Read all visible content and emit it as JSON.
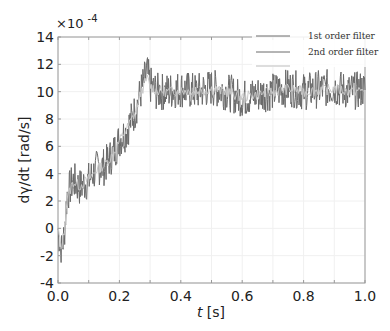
{
  "chart_data": {
    "type": "line",
    "title": "",
    "xlabel": "t [s]",
    "ylabel": "dγ/dt [rad/s]",
    "y_multiplier": "×10^-4",
    "xlim": [
      0.0,
      1.0
    ],
    "ylim": [
      -4,
      14
    ],
    "x_ticks": [
      "0.0",
      "0.2",
      "0.4",
      "0.6",
      "0.8",
      "1.0"
    ],
    "y_ticks": [
      "-4",
      "-2",
      "0",
      "2",
      "4",
      "6",
      "8",
      "10",
      "12",
      "14"
    ],
    "grid": true,
    "legend_position": "upper right",
    "legend": [
      "1st order filter",
      "2nd order filter",
      ""
    ],
    "series": [
      {
        "name": "1st order filter",
        "color": "#6a6a6a",
        "x": [
          0.0,
          0.01,
          0.02,
          0.03,
          0.05,
          0.07,
          0.1,
          0.13,
          0.15,
          0.18,
          0.2,
          0.22,
          0.25,
          0.27,
          0.29,
          0.3,
          0.32,
          0.35,
          0.4,
          0.45,
          0.5,
          0.55,
          0.6,
          0.65,
          0.7,
          0.75,
          0.8,
          0.85,
          0.9,
          0.95,
          1.0
        ],
        "values": [
          0.0,
          -1.8,
          -0.5,
          2.5,
          3.5,
          3.0,
          3.5,
          4.5,
          4.5,
          5.5,
          6.5,
          7.0,
          8.5,
          10.0,
          11.5,
          10.5,
          10.0,
          10.0,
          10.2,
          10.0,
          10.3,
          10.0,
          9.5,
          9.8,
          10.0,
          10.3,
          10.0,
          10.2,
          10.3,
          10.0,
          10.2
        ]
      },
      {
        "name": "2nd order filter",
        "color": "#bdbdbd",
        "x": [
          0.0,
          0.01,
          0.02,
          0.03,
          0.05,
          0.07,
          0.1,
          0.13,
          0.15,
          0.18,
          0.2,
          0.22,
          0.25,
          0.27,
          0.29,
          0.3,
          0.32,
          0.35,
          0.4,
          0.45,
          0.5,
          0.55,
          0.6,
          0.65,
          0.7,
          0.75,
          0.8,
          0.85,
          0.9,
          0.95,
          1.0
        ],
        "values": [
          0.0,
          -1.5,
          -0.3,
          2.3,
          3.4,
          3.1,
          3.6,
          4.4,
          4.6,
          5.4,
          6.4,
          7.1,
          8.4,
          9.9,
          11.0,
          10.4,
          10.1,
          10.0,
          10.1,
          10.0,
          10.2,
          10.0,
          9.6,
          9.8,
          10.0,
          10.2,
          10.0,
          10.1,
          10.2,
          10.0,
          10.1
        ]
      }
    ]
  }
}
